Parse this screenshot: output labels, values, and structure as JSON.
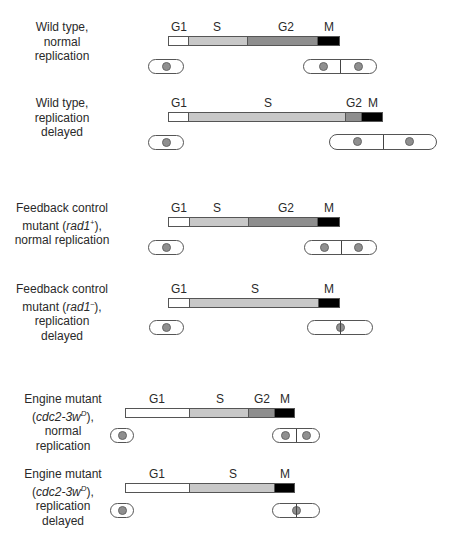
{
  "colors": {
    "G1": "#ffffff",
    "S": "#c8c8c8",
    "G2": "#8e8e8e",
    "M": "#000000",
    "nucleus": "#8f8f8f"
  },
  "rows": [
    {
      "label_lines": [
        "Wild type,",
        "normal",
        "replication"
      ],
      "label_italic": "",
      "phases": [
        {
          "name": "G1",
          "x0": 168,
          "x1": 189
        },
        {
          "name": "S",
          "x0": 189,
          "x1": 248
        },
        {
          "name": "G2",
          "x0": 248,
          "x1": 318
        },
        {
          "name": "M",
          "x0": 318,
          "x1": 340
        }
      ],
      "outcome": "two daughter cells (normal division)"
    },
    {
      "label_lines": [
        "Wild type,",
        "replication",
        "delayed"
      ],
      "phases": [
        {
          "name": "G1",
          "x0": 168,
          "x1": 189
        },
        {
          "name": "S",
          "x0": 189,
          "x1": 346
        },
        {
          "name": "G2",
          "x0": 346,
          "x1": 362
        },
        {
          "name": "M",
          "x0": 362,
          "x1": 383
        }
      ],
      "outcome": "two larger daughter cells (division delayed)"
    },
    {
      "label_lines": [
        "Feedback control",
        "mutant (rad1⁻),",
        "normal replication"
      ],
      "phases": [
        {
          "name": "G1",
          "x0": 168,
          "x1": 190
        },
        {
          "name": "S",
          "x0": 190,
          "x1": 249
        },
        {
          "name": "G2",
          "x0": 249,
          "x1": 318
        },
        {
          "name": "M",
          "x0": 318,
          "x1": 340
        }
      ],
      "outcome": "two daughter cells (normal division)"
    },
    {
      "label_lines": [
        "Feedback control",
        "mutant (rad1⁻),",
        "replication delayed"
      ],
      "phases": [
        {
          "name": "G1",
          "x0": 168,
          "x1": 190
        },
        {
          "name": "S",
          "x0": 190,
          "x1": 319
        },
        {
          "name": "M",
          "x0": 319,
          "x1": 340
        }
      ],
      "outcome": "septum cuts through nucleus (lethal)"
    },
    {
      "label_lines": [
        "Engine mutant",
        "(cdc2-3wᴰ),",
        "normal replication"
      ],
      "phases": [
        {
          "name": "G1",
          "x0": 125,
          "x1": 190
        },
        {
          "name": "S",
          "x0": 190,
          "x1": 249
        },
        {
          "name": "G2",
          "x0": 249,
          "x1": 275
        },
        {
          "name": "M",
          "x0": 275,
          "x1": 295
        }
      ],
      "outcome": "two small daughter cells"
    },
    {
      "label_lines": [
        "Engine mutant",
        "(cdc2-3wᴰ),",
        "replication delayed"
      ],
      "phases": [
        {
          "name": "G1",
          "x0": 125,
          "x1": 190
        },
        {
          "name": "S",
          "x0": 190,
          "x1": 275
        },
        {
          "name": "M",
          "x0": 275,
          "x1": 295
        }
      ],
      "outcome": "septum cuts through nucleus (lethal)"
    }
  ],
  "labels": {
    "r1": {
      "l1": "Wild type,",
      "l2": "normal",
      "l3": "replication"
    },
    "r2": {
      "l1": "Wild type,",
      "l2": "replication",
      "l3": "delayed"
    },
    "r3": {
      "l1": "Feedback control",
      "l2a": "mutant (",
      "l2i": "rad1",
      "l2sup": "+",
      "l2b": "),",
      "l3": "normal replication"
    },
    "r4": {
      "l1": "Feedback control",
      "l2a": "mutant (",
      "l2i": "rad1",
      "l2sup": "–",
      "l2b": "),",
      "l3": "replication delayed"
    },
    "r5": {
      "l1": "Engine mutant",
      "l2a": "(",
      "l2i": "cdc2-3w",
      "l2sup": "D",
      "l2b": "),",
      "l3": "normal replication"
    },
    "r6": {
      "l1": "Engine mutant",
      "l2a": "(",
      "l2i": "cdc2-3w",
      "l2sup": "D",
      "l2b": "),",
      "l3": "replication delayed"
    }
  },
  "phase_names": {
    "g1": "G1",
    "s": "S",
    "g2": "G2",
    "m": "M"
  }
}
